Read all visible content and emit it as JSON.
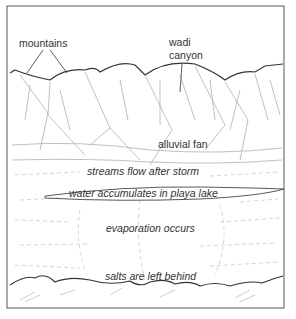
{
  "labels": {
    "mountains": "mountains",
    "wadi_line1": "wadi",
    "wadi_line2": "canyon",
    "alluvial_fan": "alluvial fan",
    "streams": "streams flow after storm",
    "playa": "water accumulates in playa lake",
    "evaporation": "evaporation occurs",
    "salts": "salts are left behind"
  },
  "colors": {
    "line": "#3a3a3a",
    "sketch": "#9a9a9a",
    "background": "#ffffff"
  }
}
